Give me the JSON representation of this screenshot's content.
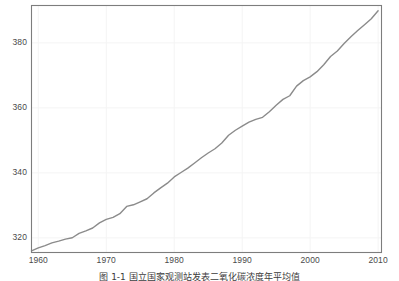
{
  "figure": {
    "caption": "图 1-1  国立国家观测站发表二氧化碳浓度年平均值",
    "background_color": "#ffffff"
  },
  "axes": {
    "frame_color": "#7d7d7d",
    "grid_color": "#f4f4f4",
    "tick_text_color": "#4a4a4a",
    "y_ticks": [
      {
        "value": 320,
        "label": "320"
      },
      {
        "value": 340,
        "label": "340"
      },
      {
        "value": 360,
        "label": "360"
      },
      {
        "value": 380,
        "label": "380"
      }
    ],
    "x_ticks": [
      {
        "value": 1960,
        "label": "1960"
      },
      {
        "value": 1970,
        "label": "1970"
      },
      {
        "value": 1980,
        "label": "1980"
      },
      {
        "value": 1990,
        "label": "1990"
      },
      {
        "value": 2000,
        "label": "2000"
      },
      {
        "value": 2010,
        "label": "2010"
      }
    ]
  },
  "chart_data": {
    "type": "line",
    "title": "",
    "subtitle": "",
    "xlabel": "",
    "ylabel": "",
    "xlim": [
      1959,
      2010.5
    ],
    "ylim": [
      315.5,
      391.5
    ],
    "grid": true,
    "legend": null,
    "series": [
      {
        "name": "CO2 annual mean concentration (ppm)",
        "color": "#8b8b8b",
        "linewidth": 1.4,
        "x": [
          1959,
          1960,
          1961,
          1962,
          1963,
          1964,
          1965,
          1966,
          1967,
          1968,
          1969,
          1970,
          1971,
          1972,
          1973,
          1974,
          1975,
          1976,
          1977,
          1978,
          1979,
          1980,
          1981,
          1982,
          1983,
          1984,
          1985,
          1986,
          1987,
          1988,
          1989,
          1990,
          1991,
          1992,
          1993,
          1994,
          1995,
          1996,
          1997,
          1998,
          1999,
          2000,
          2001,
          2002,
          2003,
          2004,
          2005,
          2006,
          2007,
          2008,
          2009,
          2010
        ],
        "values": [
          315.97,
          316.91,
          317.64,
          318.45,
          318.99,
          319.62,
          320.04,
          321.38,
          322.16,
          323.04,
          324.62,
          325.68,
          326.32,
          327.45,
          329.68,
          330.18,
          331.11,
          332.04,
          333.83,
          335.4,
          336.84,
          338.75,
          340.11,
          341.45,
          343.05,
          344.65,
          346.12,
          347.42,
          349.19,
          351.57,
          353.12,
          354.39,
          355.61,
          356.45,
          357.1,
          358.83,
          360.82,
          362.61,
          363.73,
          366.7,
          368.38,
          369.55,
          371.14,
          373.28,
          375.8,
          377.52,
          379.8,
          381.9,
          383.79,
          385.6,
          387.43,
          389.9
        ]
      }
    ]
  }
}
